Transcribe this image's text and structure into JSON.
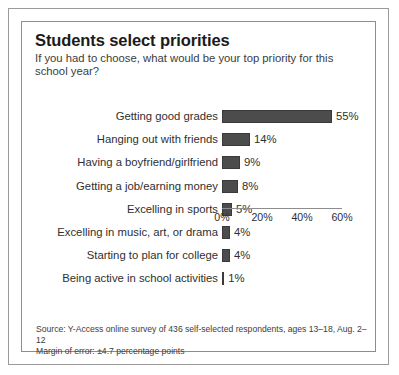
{
  "chart_data": {
    "type": "bar",
    "orientation": "horizontal",
    "title": "Students select priorities",
    "subtitle": "If you had to choose, what would be your top priority for this school year?",
    "xlabel": "",
    "ylabel": "",
    "xlim": [
      0,
      60
    ],
    "grid": false,
    "legend": null,
    "categories": [
      "Getting good grades",
      "Hanging out with friends",
      "Having a boyfriend/girlfriend",
      "Getting a job/earning money",
      "Excelling in sports",
      "Excelling in music, art, or drama",
      "Starting to plan for college",
      "Being active in school activities"
    ],
    "values": [
      55,
      14,
      9,
      8,
      5,
      4,
      4,
      1
    ],
    "value_labels": [
      "55%",
      "14%",
      "9%",
      "8%",
      "5%",
      "4%",
      "4%",
      "1%"
    ],
    "xticks": [
      0,
      20,
      40,
      60
    ],
    "xtick_labels": [
      "0%",
      "20%",
      "40%",
      "60%"
    ],
    "bar_color": "#4c4c4c"
  },
  "source": {
    "line1": "Source: Y-Access online survey of 436 self-selected respondents, ages 13–18, Aug. 2–12",
    "line2": "Margin of error: ±4.7 percentage points"
  }
}
